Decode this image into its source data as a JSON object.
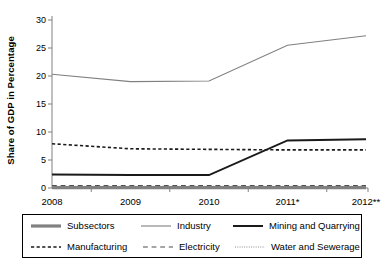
{
  "chart_data": {
    "type": "line",
    "title": "",
    "xlabel": "",
    "ylabel": "Share of GDP in Percentage",
    "categories": [
      "2008",
      "2009",
      "2010",
      "2011*",
      "2012**"
    ],
    "ylim": [
      0,
      30
    ],
    "yticks": [
      0,
      5,
      10,
      15,
      20,
      25,
      30
    ],
    "grid": false,
    "legend_position": "bottom",
    "series": [
      {
        "name": "Subsectors",
        "values": [
          0.05,
          0.05,
          0.05,
          0.05,
          0.05
        ],
        "style": "solid",
        "color": "#808080",
        "width": 3.2
      },
      {
        "name": "Industry",
        "values": [
          20.3,
          19.0,
          19.1,
          25.5,
          27.2
        ],
        "style": "solid",
        "color": "#808080",
        "width": 1.1
      },
      {
        "name": "Mining and Quarrying",
        "values": [
          2.4,
          2.3,
          2.3,
          8.5,
          8.7
        ],
        "style": "solid",
        "color": "#1a1a1a",
        "width": 2.0
      },
      {
        "name": "Manufacturing",
        "values": [
          7.9,
          7.0,
          6.9,
          6.8,
          6.8
        ],
        "style": "dashed",
        "color": "#1a1a1a",
        "width": 1.6
      },
      {
        "name": "Electricity",
        "values": [
          0.45,
          0.45,
          0.45,
          0.45,
          0.45
        ],
        "style": "longdash",
        "color": "#4d4d4d",
        "width": 1.2
      },
      {
        "name": "Water and Sewerage",
        "values": [
          0.3,
          0.3,
          0.3,
          0.3,
          0.3
        ],
        "style": "dotted",
        "color": "#808080",
        "width": 1.0
      }
    ]
  },
  "axes": {
    "axis_color": "#808080",
    "tick_color": "#808080"
  },
  "legend": {
    "rows": [
      [
        "Subsectors",
        "Industry",
        "Mining and Quarrying"
      ],
      [
        "Manufacturing",
        "Electricity",
        "Water and Sewerage"
      ]
    ]
  }
}
